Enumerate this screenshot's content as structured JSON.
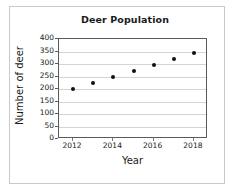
{
  "chart_data": {
    "type": "scatter",
    "title": "Deer Population",
    "xlabel": "Year",
    "ylabel": "Number of deer",
    "x": [
      2012,
      2013,
      2014,
      2015,
      2016,
      2017,
      2018
    ],
    "values": [
      200,
      225,
      249,
      272,
      297,
      320,
      345
    ],
    "points": [
      {
        "x": 2012,
        "y": 200
      },
      {
        "x": 2013,
        "y": 225
      },
      {
        "x": 2014,
        "y": 249
      },
      {
        "x": 2015,
        "y": 272
      },
      {
        "x": 2016,
        "y": 297
      },
      {
        "x": 2017,
        "y": 320
      },
      {
        "x": 2018,
        "y": 345
      }
    ],
    "xlim": [
      2011.3,
      2018.7
    ],
    "ylim": [
      0,
      400
    ],
    "yticks": [
      0,
      50,
      100,
      150,
      200,
      250,
      300,
      350,
      400
    ],
    "ytick_labels": [
      "0",
      "50",
      "100",
      "150",
      "200",
      "250",
      "300",
      "350",
      "400"
    ],
    "xticks": [
      2012,
      2014,
      2016,
      2018
    ],
    "xtick_labels": [
      "2012",
      "2014",
      "2016",
      "2018"
    ],
    "grid": true,
    "grid_axis": "y",
    "legend": false,
    "marker_color": "#111111",
    "grid_color": "#d3d3d3",
    "axis_color": "#5a5a5a",
    "background_color": "#ffffff"
  }
}
